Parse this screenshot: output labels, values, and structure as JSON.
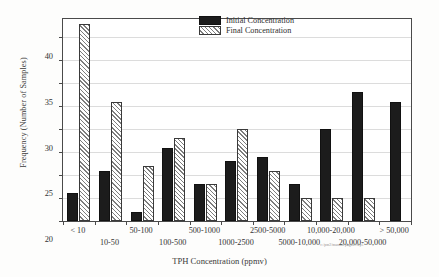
{
  "figure": {
    "annotation_filepath": "c:/pm2/manual/pbgas1.wp1"
  },
  "legend": {
    "position": "top-right-inside",
    "entries": [
      {
        "label": "Initial Concentration",
        "style": "solid-black",
        "color": "#1c1c1c"
      },
      {
        "label": "Final Concentration",
        "style": "diagonal-hatch",
        "color": "#7d7d7d"
      }
    ]
  },
  "chart_data": {
    "type": "bar",
    "title": "",
    "xlabel": "TPH Concentration (ppmv)",
    "ylabel": "Frequency (Number of Samples)",
    "ylim": [
      0,
      44
    ],
    "yticks": [
      0,
      5,
      10,
      15,
      20,
      25,
      30,
      35,
      40
    ],
    "ytick_labels": [
      "0",
      "5",
      "10",
      "15",
      "20",
      "25",
      "30",
      "35",
      "40"
    ],
    "grid": true,
    "grid_axis": "y",
    "legend_position": "upper right",
    "categories": [
      "< 10",
      "10-50",
      "50-100",
      "100-500",
      "500-1000",
      "1000-2500",
      "2500-5000",
      "5000-10,000",
      "10,000-20,000",
      "20,000-50,000",
      "> 50,000"
    ],
    "series": [
      {
        "name": "Initial Concentration",
        "values": [
          6,
          11,
          2,
          16,
          8,
          13,
          14,
          8,
          20,
          28,
          26
        ]
      },
      {
        "name": "Final Concentration",
        "values": [
          43,
          26,
          12,
          18,
          8,
          20,
          11,
          5,
          5,
          5,
          0
        ]
      }
    ]
  }
}
